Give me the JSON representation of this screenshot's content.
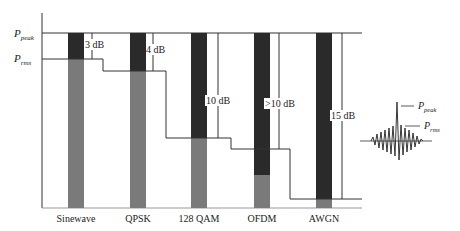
{
  "diagram": {
    "type": "peak-to-average power ratio comparison",
    "y_labels": {
      "peak": {
        "base": "P",
        "sub": "peak"
      },
      "rms": {
        "base": "P",
        "sub": "rms"
      }
    },
    "signals": [
      {
        "name": "Sinewave",
        "papr_label": "3 dB"
      },
      {
        "name": "QPSK",
        "papr_label": "4 dB"
      },
      {
        "name": "128 QAM",
        "papr_label": "10 dB"
      },
      {
        "name": "OFDM",
        "papr_label": ">10 dB"
      },
      {
        "name": "AWGN",
        "papr_label": "15 dB"
      }
    ],
    "inset": {
      "peak_label": {
        "base": "P",
        "sub": "peak"
      },
      "rms_label": {
        "base": "P",
        "sub": "rms"
      }
    },
    "colors": {
      "peak_segment": "#2a2a2a",
      "rms_segment": "#7a7a7a",
      "line": "#333333"
    }
  }
}
